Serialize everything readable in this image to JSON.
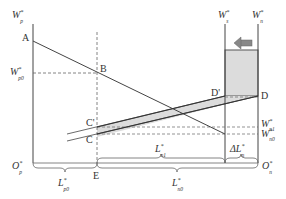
{
  "diagram": {
    "type": "two-sector labor market diagram",
    "colors": {
      "line": "#444444",
      "dashed": "#666666",
      "shade": "#dcdcdc",
      "arrow": "#888888",
      "text": "#333333"
    },
    "axes": {
      "left_top": {
        "main": "W",
        "sup": "*",
        "sub": "p"
      },
      "right_inner_top": {
        "main": "W",
        "sup": "*",
        "sub": "s"
      },
      "right_outer_top": {
        "main": "W",
        "sup": "*",
        "sub": "n"
      },
      "origin_left": {
        "main": "O",
        "sup": "*",
        "sub": "p"
      },
      "origin_right": {
        "main": "O",
        "sup": "*",
        "sub": "n"
      }
    },
    "points": {
      "A": "A",
      "B": "B",
      "C": "C",
      "C_prime": "C'",
      "D": "D",
      "D_prime": "D'",
      "E": "E"
    },
    "wage_labels": {
      "wp0": {
        "main": "W",
        "sup": "*",
        "sub": "p0"
      },
      "wn1": {
        "main": "W",
        "sup": "*",
        "sub": "n1"
      },
      "wn0": {
        "main": "W",
        "sup": "*",
        "sub": "n0"
      }
    },
    "brace_labels": {
      "Lp0": {
        "main": "L",
        "sup": "*",
        "sub": "p0"
      },
      "Ln1": {
        "main": "L",
        "sup": "*",
        "sub": "n1"
      },
      "dLn": {
        "main": "ΔL",
        "sup": "*",
        "sub": "n"
      },
      "Ln0": {
        "main": "L",
        "sup": "*",
        "sub": "n0"
      }
    },
    "arrow": {
      "direction": "left",
      "icon": "left-arrow-icon"
    }
  }
}
